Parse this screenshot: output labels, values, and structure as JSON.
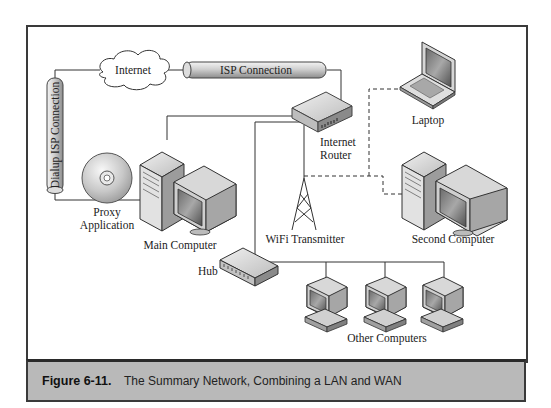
{
  "figure": {
    "number": "Figure 6-11.",
    "caption": "The Summary Network, Combining a LAN and WAN"
  },
  "nodes": {
    "internet": "Internet",
    "isp_connection": "ISP Connection",
    "dialup_isp_connection": "Dialup ISP Connection",
    "internet_router_line1": "Internet",
    "internet_router_line2": "Router",
    "laptop": "Laptop",
    "proxy_line1": "Proxy",
    "proxy_line2": "Application",
    "main_computer": "Main Computer",
    "wifi_transmitter": "WiFi Transmitter",
    "second_computer": "Second Computer",
    "hub": "Hub",
    "other_computers": "Other Computers"
  },
  "colors": {
    "caption_band": "#b9b9b9",
    "frame_border": "#3a3a3a",
    "device_light": "#e6e6e6",
    "device_mid": "#bdbdbd",
    "device_dark": "#7a7a7a"
  }
}
